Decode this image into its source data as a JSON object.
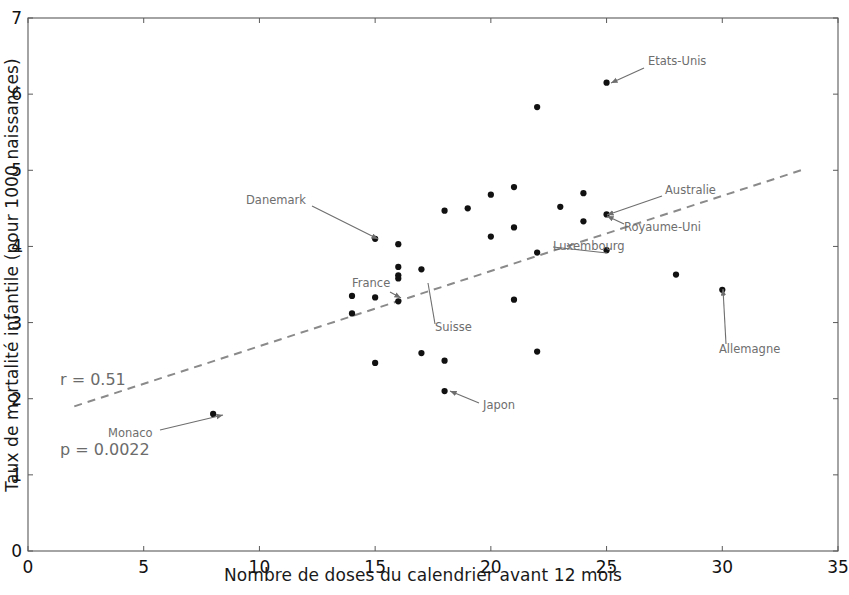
{
  "chart_data": {
    "type": "scatter",
    "title": "",
    "xlabel": "Nombre de doses du calendrier avant 12 mois",
    "ylabel": "Taux de mortalité infantile (pour 1000 naissances)",
    "xlim": [
      0,
      35
    ],
    "ylim": [
      0,
      7
    ],
    "xticks": [
      0,
      5,
      10,
      15,
      20,
      25,
      30,
      35
    ],
    "yticks": [
      0,
      1,
      2,
      3,
      4,
      5,
      6,
      7
    ],
    "xtick_labels": [
      "0",
      "5",
      "10",
      "15",
      "20",
      "25",
      "30",
      "35"
    ],
    "ytick_labels": [
      "0",
      "1",
      "2",
      "3",
      "4",
      "5",
      "6",
      "7"
    ],
    "grid": false,
    "legend": null,
    "marker_color": "#111111",
    "marker_size": 5,
    "trendline": {
      "style": "dashed",
      "color": "#8a8a8a",
      "x0": 2.0,
      "y0": 1.9,
      "x1": 33.4,
      "y1": 5.0
    },
    "points": [
      {
        "x": 8,
        "y": 1.8
      },
      {
        "x": 14,
        "y": 3.12
      },
      {
        "x": 14,
        "y": 3.35
      },
      {
        "x": 15,
        "y": 4.1
      },
      {
        "x": 15,
        "y": 3.33
      },
      {
        "x": 15,
        "y": 2.47
      },
      {
        "x": 16,
        "y": 4.03
      },
      {
        "x": 16,
        "y": 3.73
      },
      {
        "x": 16,
        "y": 3.62
      },
      {
        "x": 16,
        "y": 3.58
      },
      {
        "x": 16,
        "y": 3.28
      },
      {
        "x": 17,
        "y": 3.7
      },
      {
        "x": 17,
        "y": 2.6
      },
      {
        "x": 18,
        "y": 4.47
      },
      {
        "x": 18,
        "y": 2.5
      },
      {
        "x": 18,
        "y": 2.1
      },
      {
        "x": 19,
        "y": 4.5
      },
      {
        "x": 20,
        "y": 4.68
      },
      {
        "x": 20,
        "y": 4.13
      },
      {
        "x": 21,
        "y": 4.78
      },
      {
        "x": 21,
        "y": 4.25
      },
      {
        "x": 21,
        "y": 3.3
      },
      {
        "x": 22,
        "y": 5.83
      },
      {
        "x": 22,
        "y": 3.92
      },
      {
        "x": 22,
        "y": 2.62
      },
      {
        "x": 23,
        "y": 4.52
      },
      {
        "x": 24,
        "y": 4.7
      },
      {
        "x": 24,
        "y": 4.33
      },
      {
        "x": 25,
        "y": 6.15
      },
      {
        "x": 25,
        "y": 4.42
      },
      {
        "x": 25,
        "y": 3.95
      },
      {
        "x": 28,
        "y": 3.63
      },
      {
        "x": 30,
        "y": 3.43
      }
    ],
    "annotations": [
      {
        "label": "Etats-Unis",
        "label_x": 648,
        "label_y": 62,
        "point_x": 611,
        "point_y": 83,
        "arrow_from_x": 644,
        "arrow_from_y": 68,
        "arrow": true
      },
      {
        "label": "Danemark",
        "label_x": 246,
        "label_y": 201,
        "point_x": 378,
        "point_y": 239,
        "arrow_from_x": 312,
        "arrow_from_y": 206,
        "arrow": true
      },
      {
        "label": "Australie",
        "label_x": 665,
        "label_y": 191,
        "point_x": 607,
        "point_y": 215,
        "arrow_from_x": 662,
        "arrow_from_y": 196,
        "arrow": true
      },
      {
        "label": "Royaume-Uni",
        "label_x": 624,
        "label_y": 228,
        "point_x": 607,
        "point_y": 216,
        "arrow_from_x": 624,
        "arrow_from_y": 224,
        "arrow": true
      },
      {
        "label": "Luxembourg",
        "label_x": 553,
        "label_y": 247,
        "point_x": 607,
        "point_y": 253,
        "arrow_from_x": 553,
        "arrow_from_y": 247,
        "arrow": false
      },
      {
        "label": "France",
        "label_x": 352,
        "label_y": 284,
        "point_x": 401,
        "point_y": 298,
        "arrow_from_x": 390,
        "arrow_from_y": 292,
        "arrow": true
      },
      {
        "label": "Suisse",
        "label_x": 435,
        "label_y": 328,
        "point_x": 428,
        "point_y": 283,
        "arrow_from_x": 435,
        "arrow_from_y": 324,
        "arrow": false
      },
      {
        "label": "Japon",
        "label_x": 483,
        "label_y": 406,
        "point_x": 450,
        "point_y": 391,
        "arrow_from_x": 479,
        "arrow_from_y": 403,
        "arrow": true
      },
      {
        "label": "Allemagne",
        "label_x": 719,
        "label_y": 350,
        "point_x": 723,
        "point_y": 289,
        "arrow_from_x": 726,
        "arrow_from_y": 344,
        "arrow": true
      },
      {
        "label": "Monaco",
        "label_x": 108,
        "label_y": 434,
        "point_x": 223,
        "point_y": 415,
        "arrow_from_x": 160,
        "arrow_from_y": 430,
        "arrow": true
      }
    ],
    "stats": {
      "r_label": "r = 0.51",
      "p_label": "p = 0.0022",
      "r_value": 0.51,
      "p_value": 0.0022
    }
  }
}
